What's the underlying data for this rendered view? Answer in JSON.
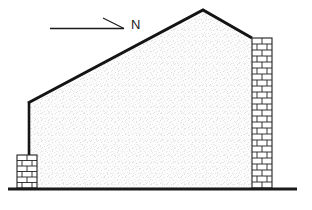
{
  "drawing": {
    "title": "Building side elevation with north direction arrow",
    "type": "architectural-elevation",
    "canvas": {
      "width": 312,
      "height": 210,
      "background": "#ffffff"
    },
    "colors": {
      "outline": "#141414",
      "ground": "#1a1a1a",
      "wall_fill": "#fbfbfb",
      "wall_stipple": "#dadada",
      "brick_fill": "#ffffff",
      "brick_mortar": "#1a1a1a",
      "label_text": "#1a1a1a"
    },
    "north_indicator": {
      "label": "N",
      "label_x": 131,
      "label_y": 29,
      "arrow": {
        "x1": 50,
        "y1": 28,
        "x2": 124,
        "y2": 28,
        "head_style": "half-barb-upper",
        "barb_x": 103,
        "barb_y": 18,
        "stroke_width": 1.2
      }
    },
    "building": {
      "outline_points": "28,103 203,10 252,38 252,188 28,188",
      "gable_apex": {
        "x": 203,
        "y": 10
      },
      "left_eave": {
        "x": 28,
        "y": 103
      },
      "right_eave": {
        "x": 252,
        "y": 38
      },
      "roof_stroke_width": 3,
      "wall_stroke_width": 2.4
    },
    "ground_line": {
      "x1": 8,
      "y1": 189,
      "x2": 297,
      "y2": 189,
      "stroke_width": 3
    },
    "brick_piers": [
      {
        "name": "left-brick-pier",
        "x": 17,
        "y": 155,
        "width": 20,
        "height": 33,
        "course_height": 5.5,
        "courses": 6
      },
      {
        "name": "right-brick-pier",
        "x": 252,
        "y": 38,
        "width": 20,
        "height": 150,
        "course_height": 6.0,
        "courses": 25
      }
    ]
  }
}
